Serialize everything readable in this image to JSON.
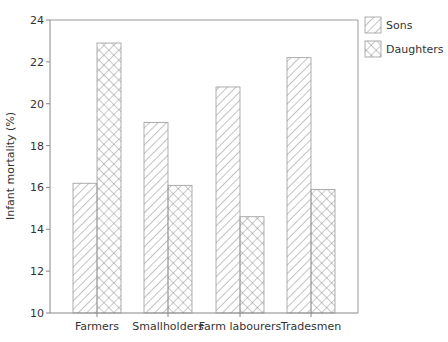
{
  "chart_data": {
    "type": "bar",
    "title": "",
    "xlabel": "",
    "ylabel": "Infant mortality (%)",
    "ylim": [
      10,
      24
    ],
    "yticks": [
      10,
      12,
      14,
      16,
      18,
      20,
      22,
      24
    ],
    "grid": false,
    "legend_position": "right-top",
    "categories": [
      "Farmers",
      "Smallholders",
      "Farm labourers",
      "Tradesmen"
    ],
    "series": [
      {
        "name": "Sons",
        "pattern": "diagonal-hatch",
        "values": [
          16.2,
          19.1,
          20.8,
          22.2
        ]
      },
      {
        "name": "Daughters",
        "pattern": "cross-hatch",
        "values": [
          22.9,
          16.1,
          14.6,
          15.9
        ]
      }
    ]
  },
  "legend": {
    "items": [
      {
        "label": "Sons",
        "icon": "diagonal-hatch-swatch"
      },
      {
        "label": "Daughters",
        "icon": "cross-hatch-swatch"
      }
    ]
  },
  "axes": {
    "y_title": "Infant mortality (%)",
    "y_ticks": [
      "10",
      "12",
      "14",
      "16",
      "18",
      "20",
      "22",
      "24"
    ],
    "x_labels": [
      "Farmers",
      "Smallholders",
      "Farm labourers",
      "Tradesmen"
    ]
  },
  "colors": {
    "axis": "#888888",
    "hatch": "#666666",
    "text": "#333333"
  }
}
